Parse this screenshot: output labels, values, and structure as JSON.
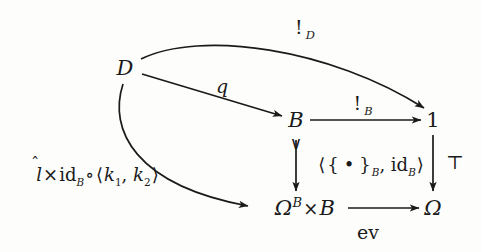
{
  "diagram": {
    "background_color": "#fdfdfc",
    "ink_color": "#1a1a1a",
    "nodes": [
      {
        "id": "D",
        "label": "D",
        "x": 125,
        "y": 68
      },
      {
        "id": "B",
        "label": "B",
        "x": 296,
        "y": 120
      },
      {
        "id": "one",
        "label": "1",
        "x": 433,
        "y": 120
      },
      {
        "id": "omegaB",
        "label_base": "Ω",
        "label_sup": "B",
        "label_times": "×",
        "label_tail": "B",
        "x": 305,
        "y": 208
      },
      {
        "id": "omega",
        "label": "Ω",
        "x": 433,
        "y": 208
      }
    ],
    "edges": [
      {
        "id": "d-to-one",
        "from": "D",
        "to": "one",
        "kind": "curve-top",
        "label": "!",
        "label_sub": "D"
      },
      {
        "id": "d-to-b",
        "from": "D",
        "to": "B",
        "kind": "straight",
        "label": "q"
      },
      {
        "id": "b-to-one",
        "from": "B",
        "to": "one",
        "kind": "straight",
        "label": "!",
        "label_sub": "B"
      },
      {
        "id": "b-to-omegaB",
        "from": "B",
        "to": "omegaB",
        "kind": "vertical-mono",
        "label": "⟨{ • }_B, id_B⟩"
      },
      {
        "id": "one-to-omega",
        "from": "one",
        "to": "omega",
        "kind": "vertical",
        "label": "⊤"
      },
      {
        "id": "d-to-omegaB",
        "from": "D",
        "to": "omegaB",
        "kind": "curve-left",
        "label": "l̂×id_B∘⟨k₁, k₂⟩"
      },
      {
        "id": "omegaB-to-omega",
        "from": "omegaB",
        "to": "omega",
        "kind": "straight",
        "label": "ev"
      }
    ],
    "labels": {
      "bang_d": {
        "bang": "!",
        "sub": "D",
        "x": 305,
        "y": 27
      },
      "q": {
        "text": "q",
        "x": 222,
        "y": 86
      },
      "bang_b": {
        "bang": "!",
        "sub": "B",
        "x": 363,
        "y": 103
      },
      "singleton": {
        "open": "⟨",
        "lbrace": "{",
        "dot": "•",
        "rbrace": "}",
        "sub1": "B",
        "comma": ", ",
        "id": "id",
        "sub2": "B",
        "close": "⟩",
        "x": 371,
        "y": 165
      },
      "top": {
        "text": "⊤",
        "x": 455,
        "y": 162
      },
      "left_comp": {
        "lhat": "l",
        "hat": "̂",
        "times": "×",
        "id": "id",
        "sub_b": "B",
        "circ": "∘",
        "open": "⟨",
        "k1": "k",
        "k1sub": "1",
        "comma": ", ",
        "k2": "k",
        "k2sub": "2",
        "close": "⟩",
        "x": 98,
        "y": 175
      },
      "ev": {
        "text": "ev",
        "x": 368,
        "y": 232
      }
    }
  }
}
